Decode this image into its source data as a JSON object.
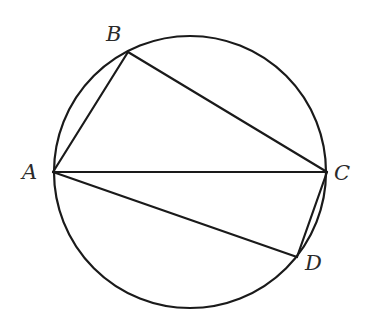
{
  "diagram": {
    "type": "inscribed-quadrilateral",
    "circle": {
      "cx": 190,
      "cy": 172,
      "r": 136
    },
    "points": {
      "A": {
        "label": "A",
        "x": 53,
        "y": 172
      },
      "B": {
        "label": "B",
        "x": 128,
        "y": 52
      },
      "C": {
        "label": "C",
        "x": 327,
        "y": 172
      },
      "D": {
        "label": "D",
        "x": 297,
        "y": 257
      }
    },
    "segments": [
      [
        "A",
        "B"
      ],
      [
        "B",
        "C"
      ],
      [
        "A",
        "C"
      ],
      [
        "A",
        "D"
      ],
      [
        "C",
        "D"
      ]
    ],
    "stroke_color": "#1a1a1a",
    "label_color": "#2a2a2a"
  }
}
